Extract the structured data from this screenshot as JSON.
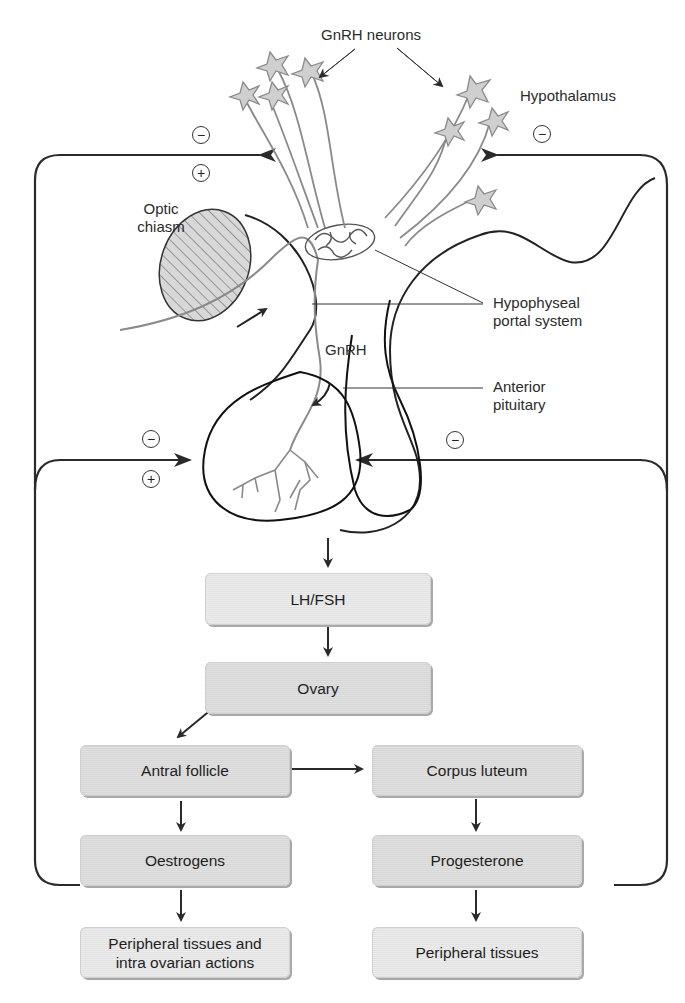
{
  "labels": {
    "gnrh_neurons": "GnRH neurons",
    "hypothalamus": "Hypothalamus",
    "optic_chiasm_line1": "Optic",
    "optic_chiasm_line2": "chiasm",
    "portal_line1": "Hypophyseal",
    "portal_line2": "portal system",
    "gnrh": "GnRH",
    "anterior_pituitary_line1": "Anterior",
    "anterior_pituitary_line2": "pituitary"
  },
  "signs": {
    "minus": "−",
    "plus": "+"
  },
  "boxes": {
    "lh_fsh": "LH/FSH",
    "ovary": "Ovary",
    "antral_follicle": "Antral follicle",
    "corpus_luteum": "Corpus luteum",
    "oestrogens": "Oestrogens",
    "progesterone": "Progesterone",
    "peripheral_left_line1": "Peripheral tissues and",
    "peripheral_left_line2": "intra ovarian actions",
    "peripheral_right": "Peripheral tissues"
  },
  "feedback": {
    "oestrogen_to_hypothalamus": [
      "−",
      "+"
    ],
    "oestrogen_to_pituitary": [
      "−",
      "+"
    ],
    "progesterone_to_hypothalamus": [
      "−"
    ],
    "progesterone_to_pituitary": [
      "−"
    ]
  },
  "colors": {
    "line": "#2a2a2a",
    "neuron_stroke": "#8a8a8a",
    "neuron_fill": "#cfcfcf",
    "box_fill": "#dcdcdc",
    "box_light_fill": "#e8e8e8"
  }
}
